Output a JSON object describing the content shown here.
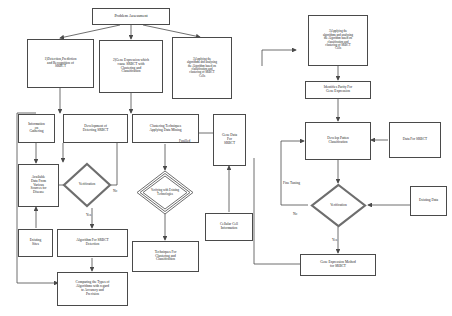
{
  "diagram": {
    "type": "flowchart",
    "nodes": {
      "problem_assessment": "Problem Assessment",
      "objective_1": "1)Detection,Prediction\nand Recognition of\nSRBCT",
      "objective_2": "2)Gene Expression which\ncause SRBCT with\nClustering and\nClassification",
      "objective_3": "3)Applying the\nalgorithms and analysing\nthe Algorithm based on\nclassification and\nclustering of SRBCT\nCells",
      "information_gathering": "Information\non\nGathering",
      "development_detecting": "Development of\nDetecting SRBCT",
      "clustering_techniques": "Clustering Techniques\nApplying Data Mining",
      "gene_data_srbct": "Gene Data\nFor\nSRBCT",
      "available_data": "Available\nData From\nVarious\nSources for\nDisease",
      "verification_left": "Verification",
      "verifying_existing": "Verifying with Existing\nTechnologies",
      "cellular_cell_information": "Cellular Cell\nInformation",
      "existing_sites": "Existing\nSites",
      "algorithm_detection": "Algorithm For SRBCT\nDetection",
      "techniques_clustering": "Techniques For\nClustering and\nClassification",
      "comparing_types": "Comparing the Types of\nAlgorithms with regard\nto Accuracy and\nPrecision",
      "objective_3_right": "3)Applying the\nalgorithms and analysing\nthe Algorithm based on\nclassification and\nclustering of SRBCT\nCells",
      "identifies_purity": "Identifies Purity For\nGene Expression",
      "develop_pattern": "Develop Patten\nClassification",
      "data_for_srbct": "Data For SRBCT",
      "verification_right": "Verification",
      "existing_data": "Existing Data",
      "gene_expression_method": "Gene Expression Method\nfor SRBCT"
    },
    "edge_labels": {
      "no_left": "No",
      "yes_left": "Yes",
      "fusilled": "Fusilled",
      "fine_tuning": "Fine Tuning",
      "no_right": "No",
      "yes_right": "Yes"
    },
    "colors": {
      "stroke": "#4a4a4a",
      "diamond_stroke": "#6e6e6e",
      "text": "#1a1a1a",
      "background": "#ffffff"
    }
  }
}
